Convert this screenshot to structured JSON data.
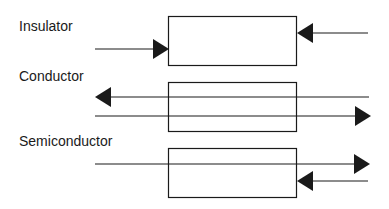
{
  "diagram": {
    "colors": {
      "stroke": "#1a1a1a",
      "background": "#ffffff"
    },
    "panels": [
      {
        "label": "Insulator",
        "description": "Incoming light blocked from both sides; no transmission"
      },
      {
        "label": "Conductor",
        "description": "Light passes through in both directions"
      },
      {
        "label": "Semiconductor",
        "description": "Light passes through and is partially reflected"
      }
    ]
  }
}
